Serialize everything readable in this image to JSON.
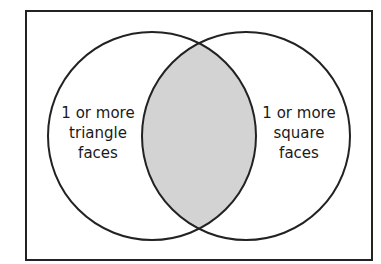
{
  "diagram": {
    "type": "venn",
    "sets": [
      {
        "label_lines": [
          "1 or more",
          "triangle",
          "faces"
        ]
      },
      {
        "label_lines": [
          "1 or more",
          "square",
          "faces"
        ]
      }
    ],
    "shaded_region": "intersection",
    "colors": {
      "outline": "#222222",
      "shade": "#d3d3d3",
      "background": "#ffffff"
    }
  }
}
